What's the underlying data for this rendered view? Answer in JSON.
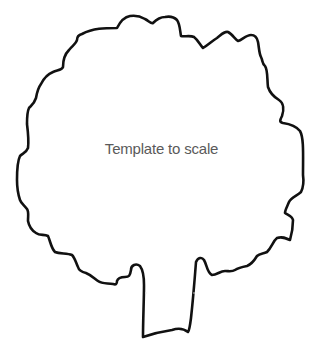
{
  "caption": "Template to scale",
  "shape": {
    "type": "tree-outline",
    "stroke_color": "#111111",
    "fill_color": "#ffffff"
  }
}
